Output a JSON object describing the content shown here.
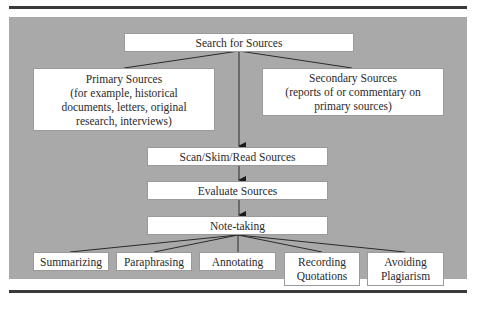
{
  "diagram": {
    "root": {
      "label": "Search for Sources"
    },
    "source_types": [
      {
        "label": "Primary Sources\n(for example, historical documents, letters, original research, interviews)",
        "title": "Primary Sources",
        "detail": "(for example, historical documents, letters, original research, interviews)"
      },
      {
        "label": "Secondary Sources\n(reports of or commentary on primary sources)",
        "title": "Secondary Sources",
        "detail": "(reports of or commentary on primary sources)"
      }
    ],
    "steps": [
      {
        "label": "Scan/Skim/Read Sources"
      },
      {
        "label": "Evaluate Sources"
      },
      {
        "label": "Note-taking"
      }
    ],
    "note_taking_children": [
      {
        "label": "Summarizing"
      },
      {
        "label": "Paraphrasing"
      },
      {
        "label": "Annotating"
      },
      {
        "label": "Recording Quotations"
      },
      {
        "label": "Avoiding Plagiarism"
      }
    ]
  },
  "colors": {
    "panel_bg": "#a9a9a9",
    "box_bg": "#ffffff",
    "line": "#2a2a2a",
    "rule": "#3a3a3a"
  }
}
